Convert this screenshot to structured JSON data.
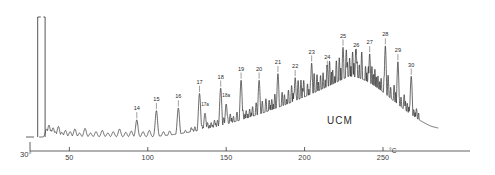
{
  "chart_data": {
    "type": "line",
    "title": "",
    "subtitle": "",
    "xlabel": "",
    "ylabel": "",
    "unit_label": "°C",
    "origin_label": "30°",
    "xlim": [
      30,
      265
    ],
    "ylim": [
      0,
      100
    ],
    "grid": false,
    "legend": null,
    "axis_ticks": [
      {
        "value": 50,
        "label": "50"
      },
      {
        "value": 100,
        "label": "100"
      },
      {
        "value": 150,
        "label": "150"
      },
      {
        "value": 200,
        "label": "200"
      },
      {
        "value": 250,
        "label": "250"
      }
    ],
    "annotations": [
      {
        "text": "UCM",
        "x": 222,
        "y": 18,
        "name": "ucm-annotation"
      }
    ],
    "solvent_peak": {
      "x": 32.5,
      "clipped": true,
      "label": "off-scale-solvent-peak"
    },
    "baseline_hump": {
      "name": "UCM",
      "description": "unresolved complex mixture broad hump",
      "start_x": 95,
      "peak_x": 228,
      "end_x": 268,
      "peak_height": 46
    },
    "labeled_peaks": [
      {
        "label": "14",
        "x": 93.0,
        "height": 13
      },
      {
        "label": "15",
        "x": 105.5,
        "height": 20
      },
      {
        "label": "16",
        "x": 119.5,
        "height": 22
      },
      {
        "label": "17",
        "x": 133.0,
        "height": 33
      },
      {
        "label": "17a",
        "x": 136.5,
        "height": 18
      },
      {
        "label": "18",
        "x": 146.5,
        "height": 37
      },
      {
        "label": "18a",
        "x": 150.0,
        "height": 25
      },
      {
        "label": "19",
        "x": 159.5,
        "height": 43
      },
      {
        "label": "20",
        "x": 171.0,
        "height": 43
      },
      {
        "label": "21",
        "x": 183.0,
        "height": 48
      },
      {
        "label": "22",
        "x": 194.0,
        "height": 45
      },
      {
        "label": "23",
        "x": 204.5,
        "height": 56
      },
      {
        "label": "24",
        "x": 214.5,
        "height": 52
      },
      {
        "label": "25",
        "x": 224.5,
        "height": 68
      },
      {
        "label": "26",
        "x": 233.0,
        "height": 61
      },
      {
        "label": "27",
        "x": 241.5,
        "height": 63
      },
      {
        "label": "28",
        "x": 251.5,
        "height": 69
      },
      {
        "label": "29",
        "x": 259.5,
        "height": 57
      },
      {
        "label": "30",
        "x": 268.0,
        "height": 46
      }
    ],
    "colors": {
      "trace": "#2b2b2b",
      "axis": "#3a3a3a",
      "background": "#ffffff",
      "label": "#2b2b2b"
    }
  }
}
